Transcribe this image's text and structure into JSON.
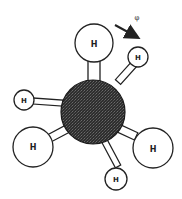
{
  "diagram": {
    "rotation_label": "φ",
    "central_atom": {
      "label": "",
      "cx": 93,
      "cy": 112,
      "r": 32,
      "fill": "#3a3a3a"
    },
    "atoms": [
      {
        "id": "top",
        "label": "H",
        "cx": 94,
        "cy": 43,
        "r": 19,
        "font": 8
      },
      {
        "id": "upper-right",
        "label": "H",
        "cx": 138,
        "cy": 57,
        "r": 10,
        "font": 7
      },
      {
        "id": "left-small",
        "label": "H",
        "cx": 24,
        "cy": 100,
        "r": 10,
        "font": 7
      },
      {
        "id": "lower-left",
        "label": "H",
        "cx": 33,
        "cy": 147,
        "r": 20,
        "font": 8
      },
      {
        "id": "lower-right",
        "label": "H",
        "cx": 153,
        "cy": 148,
        "r": 20,
        "font": 8
      },
      {
        "id": "bottom",
        "label": "H",
        "cx": 116,
        "cy": 179,
        "r": 11,
        "font": 7
      }
    ],
    "arrow": {
      "x1": 115,
      "y1": 25,
      "x2": 140,
      "y2": 39
    },
    "phi_pos": {
      "x": 137,
      "y": 18
    }
  }
}
